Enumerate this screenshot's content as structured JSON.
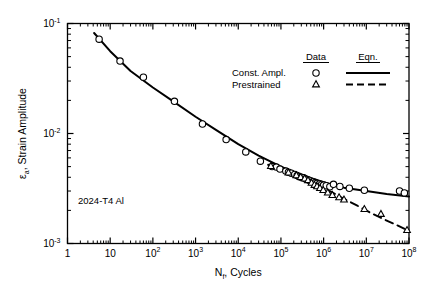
{
  "chart_data": {
    "type": "scatter",
    "title": "",
    "xlabel": "N_f, Cycles",
    "xlabel_main": "N",
    "xlabel_sub": "f",
    "xlabel_rest": ", Cycles",
    "ylabel": "ε_a, Strain Amplitude",
    "ylabel_main": "ε",
    "ylabel_sub": "a",
    "ylabel_rest": ", Strain Amplitude",
    "xscale": "log",
    "yscale": "log",
    "xlim": [
      1,
      100000000
    ],
    "ylim": [
      0.001,
      0.1
    ],
    "grid": false,
    "xticks": [
      1,
      10,
      100,
      1000,
      10000,
      100000,
      1000000,
      10000000,
      100000000
    ],
    "xtick_labels": [
      "1",
      "10",
      "10²",
      "10³",
      "10⁴",
      "10⁵",
      "10⁶",
      "10⁷",
      "10⁸"
    ],
    "xtick_mantissa": [
      "1",
      "10",
      "10",
      "10",
      "10",
      "10",
      "10",
      "10",
      "10"
    ],
    "xtick_exponent": [
      "",
      "",
      "2",
      "3",
      "4",
      "5",
      "6",
      "7",
      "8"
    ],
    "yticks": [
      0.1,
      0.01,
      0.001
    ],
    "ytick_labels": [
      "10⁻¹",
      "10⁻²",
      "10⁻³"
    ],
    "ytick_mantissa": [
      "10",
      "10",
      "10"
    ],
    "ytick_exponent": [
      "-1",
      "-2",
      "-3"
    ],
    "annotation": "2024-T4 Al",
    "legend": {
      "position": "top-right",
      "col_headers": [
        "Data",
        "Eqn."
      ],
      "rows": [
        {
          "label": "Const. Ampl.",
          "marker": "circle",
          "line": "solid"
        },
        {
          "label": "Prestrained",
          "marker": "triangle",
          "line": "dashed"
        }
      ]
    },
    "series": [
      {
        "name": "Const. Ampl.",
        "marker": "circle",
        "line_style": "solid",
        "points": [
          [
            5.5,
            0.072
          ],
          [
            17,
            0.0455
          ],
          [
            60,
            0.0325
          ],
          [
            320,
            0.0196
          ],
          [
            1450,
            0.0122
          ],
          [
            5200,
            0.0088
          ],
          [
            15000,
            0.0068
          ],
          [
            33000,
            0.0056
          ],
          [
            62000,
            0.005
          ],
          [
            78000,
            0.00495
          ],
          [
            95000,
            0.00475
          ],
          [
            130000,
            0.00455
          ],
          [
            150000,
            0.00445
          ],
          [
            175000,
            0.00435
          ],
          [
            210000,
            0.00425
          ],
          [
            240000,
            0.00415
          ],
          [
            270000,
            0.00405
          ],
          [
            300000,
            0.004
          ],
          [
            340000,
            0.00395
          ],
          [
            380000,
            0.00385
          ],
          [
            430000,
            0.0038
          ],
          [
            490000,
            0.0037
          ],
          [
            560000,
            0.00365
          ],
          [
            640000,
            0.00358
          ],
          [
            700000,
            0.00352
          ],
          [
            800000,
            0.00348
          ],
          [
            900000,
            0.00344
          ],
          [
            1000000,
            0.0034
          ],
          [
            1150000,
            0.00335
          ],
          [
            1400000,
            0.00328
          ],
          [
            1700000,
            0.00345
          ],
          [
            2400000,
            0.0033
          ],
          [
            4000000,
            0.00318
          ],
          [
            9000000,
            0.00305
          ],
          [
            60000000,
            0.003
          ],
          [
            78000000,
            0.00288
          ]
        ]
      },
      {
        "name": "Prestrained",
        "marker": "triangle",
        "line_style": "dashed",
        "points": [
          [
            58000,
            0.00505
          ],
          [
            150000,
            0.0044
          ],
          [
            230000,
            0.00415
          ],
          [
            290000,
            0.004
          ],
          [
            360000,
            0.00388
          ],
          [
            430000,
            0.00375
          ],
          [
            520000,
            0.00355
          ],
          [
            610000,
            0.0034
          ],
          [
            700000,
            0.0033
          ],
          [
            820000,
            0.00318
          ],
          [
            980000,
            0.00305
          ],
          [
            1250000,
            0.0029
          ],
          [
            1600000,
            0.00275
          ],
          [
            2300000,
            0.00262
          ],
          [
            3000000,
            0.0025
          ],
          [
            9000000,
            0.00205
          ],
          [
            22000000,
            0.00185
          ],
          [
            90000000,
            0.00132
          ]
        ]
      }
    ],
    "fit_curves": [
      {
        "name": "Const. Ampl. Eqn.",
        "style": "solid",
        "points": [
          [
            4.2,
            0.082
          ],
          [
            10,
            0.056
          ],
          [
            30,
            0.037
          ],
          [
            100,
            0.0262
          ],
          [
            300,
            0.0196
          ],
          [
            1000,
            0.0142
          ],
          [
            3000,
            0.0108
          ],
          [
            10000,
            0.008
          ],
          [
            30000,
            0.0063
          ],
          [
            100000,
            0.005
          ],
          [
            300000,
            0.0042
          ],
          [
            1000000,
            0.0036
          ],
          [
            3000000,
            0.00322
          ],
          [
            10000000,
            0.003
          ],
          [
            30000000,
            0.00282
          ],
          [
            100000000,
            0.00268
          ]
        ]
      },
      {
        "name": "Prestrained Eqn.",
        "style": "dashed",
        "points": [
          [
            50000,
            0.0052
          ],
          [
            100000,
            0.0047
          ],
          [
            200000,
            0.00422
          ],
          [
            400000,
            0.00378
          ],
          [
            800000,
            0.0033
          ],
          [
            1500000,
            0.00295
          ],
          [
            3000000,
            0.00255
          ],
          [
            6000000,
            0.00222
          ],
          [
            12000000,
            0.00192
          ],
          [
            25000000,
            0.00167
          ],
          [
            50000000,
            0.00148
          ],
          [
            100000000,
            0.0013
          ]
        ]
      }
    ]
  }
}
